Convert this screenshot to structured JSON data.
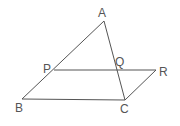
{
  "diagram": {
    "type": "geometry",
    "points": {
      "A": {
        "label": "A",
        "x": 104,
        "y": 21,
        "lx": 98,
        "ly": 17
      },
      "B": {
        "label": "B",
        "x": 22,
        "y": 99,
        "lx": 15,
        "ly": 112
      },
      "C": {
        "label": "C",
        "x": 125,
        "y": 100,
        "lx": 120,
        "ly": 113
      },
      "P": {
        "label": "P",
        "x": 54,
        "y": 70,
        "lx": 43,
        "ly": 73
      },
      "Q": {
        "label": "Q",
        "x": 117,
        "y": 70,
        "lx": 115,
        "ly": 66
      },
      "R": {
        "label": "R",
        "x": 156,
        "y": 70,
        "lx": 159,
        "ly": 76
      }
    },
    "segments": [
      "AB",
      "AC",
      "BC",
      "PR",
      "RC"
    ],
    "stroke_color": "#555555"
  }
}
